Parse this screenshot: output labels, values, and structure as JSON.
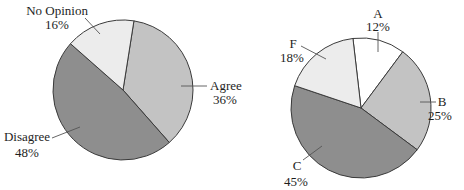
{
  "chart_data": [
    {
      "type": "pie",
      "title": "",
      "categories": [
        "Agree",
        "Disagree",
        "No Opinion"
      ],
      "values": [
        36,
        48,
        16
      ],
      "labels": [
        "36%",
        "48%",
        "16%"
      ],
      "colors": [
        "#c3c3c3",
        "#8e8e8e",
        "#ececec"
      ],
      "start_angle_deg": 9,
      "direction": "clockwise"
    },
    {
      "type": "pie",
      "title": "English Grades",
      "categories": [
        "A",
        "B",
        "C",
        "F"
      ],
      "values": [
        12,
        25,
        45,
        18
      ],
      "labels": [
        "12%",
        "25%",
        "45%",
        "18%"
      ],
      "colors": [
        "#ffffff",
        "#c3c3c3",
        "#8e8e8e",
        "#ececec"
      ],
      "start_angle_deg": -6.6,
      "direction": "clockwise"
    }
  ],
  "left": {
    "labels": {
      "agree": {
        "name": "Agree",
        "pct": "36%"
      },
      "disagree": {
        "name": "Disagree",
        "pct": "48%"
      },
      "no_opinion": {
        "name": "No Opinion",
        "pct": "16%"
      }
    }
  },
  "right": {
    "title": "English Grades",
    "labels": {
      "a": {
        "name": "A",
        "pct": "12%"
      },
      "b": {
        "name": "B",
        "pct": "25%"
      },
      "c": {
        "name": "C",
        "pct": "45%"
      },
      "f": {
        "name": "F",
        "pct": "18%"
      }
    }
  }
}
